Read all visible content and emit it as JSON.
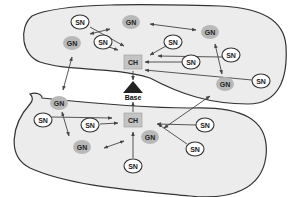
{
  "diagram": {
    "colors": {
      "region_fill": "#ececec",
      "region_stroke": "#333333",
      "sn_fill": "#ffffff",
      "sn_stroke": "#333333",
      "gn_fill": "#b8b8b8",
      "ch_fill": "#c4c4c4",
      "ch_stroke": "#999999",
      "edge": "#444444",
      "base": "#222222"
    },
    "base": {
      "label": "Base",
      "x": 133,
      "y": 90
    },
    "regions": [
      {
        "name": "top-cluster",
        "path": "M 32 16 C 60 2, 150 4, 220 6 C 262 8, 284 20, 286 46 C 288 80, 278 104, 248 104 C 210 104, 180 94, 150 78 C 110 66, 70 72, 40 62 C 22 56, 18 28, 32 16 Z"
      },
      {
        "name": "bottom-cluster",
        "path": "M 30 94 C 36 92, 42 94, 42 98 C 80 102, 140 108, 190 108 C 240 106, 270 118, 266 156 C 262 190, 230 200, 190 196 C 130 190, 70 186, 30 168 C 6 156, 12 124, 30 104 C 34 100, 32 96, 30 94 Z"
      }
    ],
    "nodes": [
      {
        "id": "t-sn1",
        "type": "SN",
        "label": "SN",
        "x": 80,
        "y": 22
      },
      {
        "id": "t-gn1",
        "type": "GN",
        "label": "GN",
        "x": 131,
        "y": 22
      },
      {
        "id": "t-gn2",
        "type": "GN",
        "label": "GN",
        "x": 72,
        "y": 43
      },
      {
        "id": "t-sn2",
        "type": "SN",
        "label": "SN",
        "x": 103,
        "y": 42
      },
      {
        "id": "t-gn3",
        "type": "GN",
        "label": "GN",
        "x": 210,
        "y": 32
      },
      {
        "id": "t-sn3",
        "type": "SN",
        "label": "SN",
        "x": 173,
        "y": 42
      },
      {
        "id": "t-sn4",
        "type": "SN",
        "label": "SN",
        "x": 231,
        "y": 55
      },
      {
        "id": "t-ch",
        "type": "CH",
        "label": "CH",
        "x": 133,
        "y": 62
      },
      {
        "id": "t-sn5",
        "type": "SN",
        "label": "SN",
        "x": 191,
        "y": 62
      },
      {
        "id": "t-gn4",
        "type": "GN",
        "label": "GN",
        "x": 225,
        "y": 84
      },
      {
        "id": "t-sn6",
        "type": "SN",
        "label": "SN",
        "x": 261,
        "y": 81
      },
      {
        "id": "b-gn1",
        "type": "GN",
        "label": "GN",
        "x": 59,
        "y": 103
      },
      {
        "id": "b-sn1",
        "type": "SN",
        "label": "SN",
        "x": 43,
        "y": 120
      },
      {
        "id": "b-sn2",
        "type": "SN",
        "label": "SN",
        "x": 90,
        "y": 125
      },
      {
        "id": "b-ch",
        "type": "CH",
        "label": "CH",
        "x": 133,
        "y": 120
      },
      {
        "id": "b-sn3",
        "type": "SN",
        "label": "SN",
        "x": 205,
        "y": 125
      },
      {
        "id": "b-gn2",
        "type": "GN",
        "label": "GN",
        "x": 150,
        "y": 137
      },
      {
        "id": "b-gn3",
        "type": "GN",
        "label": "GN",
        "x": 82,
        "y": 147
      },
      {
        "id": "b-sn4",
        "type": "SN",
        "label": "SN",
        "x": 195,
        "y": 149
      },
      {
        "id": "b-sn5",
        "type": "SN",
        "label": "SN",
        "x": 133,
        "y": 166
      }
    ],
    "edges": [
      {
        "x1": 90,
        "y1": 27,
        "x2": 124,
        "y2": 46,
        "arrow": "end"
      },
      {
        "x1": 90,
        "y1": 34,
        "x2": 110,
        "y2": 29,
        "arrow": "both"
      },
      {
        "x1": 109,
        "y1": 47,
        "x2": 118,
        "y2": 50,
        "arrow": "end"
      },
      {
        "x1": 150,
        "y1": 24,
        "x2": 196,
        "y2": 30,
        "arrow": "both"
      },
      {
        "x1": 72,
        "y1": 57,
        "x2": 63,
        "y2": 90,
        "arrow": "both"
      },
      {
        "x1": 166,
        "y1": 46,
        "x2": 150,
        "y2": 55,
        "arrow": "end"
      },
      {
        "x1": 222,
        "y1": 57,
        "x2": 158,
        "y2": 56,
        "arrow": "end"
      },
      {
        "x1": 182,
        "y1": 62,
        "x2": 145,
        "y2": 62,
        "arrow": "end"
      },
      {
        "x1": 252,
        "y1": 80,
        "x2": 145,
        "y2": 70,
        "arrow": "end"
      },
      {
        "x1": 215,
        "y1": 44,
        "x2": 222,
        "y2": 74,
        "arrow": "both"
      },
      {
        "x1": 133,
        "y1": 71,
        "x2": 133,
        "y2": 80,
        "arrow": "end"
      },
      {
        "x1": 133,
        "y1": 112,
        "x2": 133,
        "y2": 102,
        "arrow": "end"
      },
      {
        "x1": 52,
        "y1": 117,
        "x2": 112,
        "y2": 118,
        "arrow": "end"
      },
      {
        "x1": 62,
        "y1": 112,
        "x2": 69,
        "y2": 136,
        "arrow": "both"
      },
      {
        "x1": 100,
        "y1": 124,
        "x2": 118,
        "y2": 123,
        "arrow": "end"
      },
      {
        "x1": 104,
        "y1": 148,
        "x2": 124,
        "y2": 141,
        "arrow": "both"
      },
      {
        "x1": 133,
        "y1": 158,
        "x2": 133,
        "y2": 132,
        "arrow": "end"
      },
      {
        "x1": 196,
        "y1": 125,
        "x2": 157,
        "y2": 124,
        "arrow": "end"
      },
      {
        "x1": 187,
        "y1": 144,
        "x2": 158,
        "y2": 124,
        "arrow": "end"
      },
      {
        "x1": 164,
        "y1": 128,
        "x2": 210,
        "y2": 96,
        "arrow": "both"
      }
    ]
  }
}
